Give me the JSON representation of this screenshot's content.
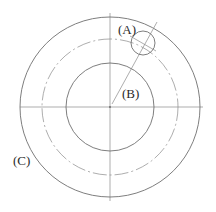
{
  "diagram": {
    "title": "",
    "labels": {
      "a": "(A)",
      "b": "(B)",
      "c": "(C)"
    },
    "center": [
      110,
      107
    ],
    "outer_circle_radius": 90,
    "pitch_circle_radius": 68,
    "inner_circle_radius": 44,
    "small_circle": {
      "center": [
        143,
        43
      ],
      "radius": 12
    },
    "colors": {
      "line": "#6f6f6f",
      "text": "#2a2a2a",
      "background": "#ffffff"
    }
  }
}
